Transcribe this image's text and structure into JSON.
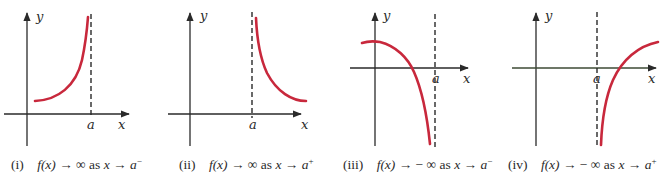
{
  "figure": {
    "panels": [
      {
        "id": "i",
        "numeral": "(i)",
        "fx": "f(x)",
        "arrow": "→",
        "limit": "∞",
        "as": "as",
        "xvar": "x",
        "a": "a",
        "side": "−",
        "axis_x_label": "x",
        "axis_y_label": "y",
        "asymptote_label": "a",
        "behavior": "increases to +∞ as x approaches a from the left"
      },
      {
        "id": "ii",
        "numeral": "(ii)",
        "fx": "f(x)",
        "arrow": "→",
        "limit": "∞",
        "as": "as",
        "xvar": "x",
        "a": "a",
        "side": "+",
        "axis_x_label": "x",
        "axis_y_label": "y",
        "asymptote_label": "a",
        "behavior": "increases to +∞ as x approaches a from the right"
      },
      {
        "id": "iii",
        "numeral": "(iii)",
        "fx": "f(x)",
        "arrow": "→",
        "limit": "− ∞",
        "as": "as",
        "xvar": "x",
        "a": "a",
        "side": "−",
        "axis_x_label": "x",
        "axis_y_label": "y",
        "asymptote_label": "a",
        "behavior": "decreases to −∞ as x approaches a from the left"
      },
      {
        "id": "iv",
        "numeral": "(iv)",
        "fx": "f(x)",
        "arrow": "→",
        "limit": "− ∞",
        "as": "as",
        "xvar": "x",
        "a": "a",
        "side": "+",
        "axis_x_label": "x",
        "axis_y_label": "y",
        "asymptote_label": "a",
        "behavior": "decreases to −∞ as x approaches a from the right"
      }
    ],
    "colors": {
      "curve": "#c8283c",
      "axis": "#2a2a2a",
      "axis_panel_iv": "#3d4a35"
    }
  }
}
